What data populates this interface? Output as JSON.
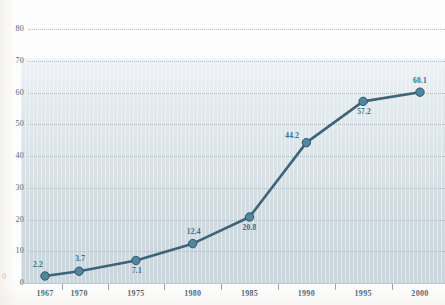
{
  "chart_data": {
    "type": "line",
    "title": "",
    "subtitle": "",
    "xlabel": "",
    "ylabel": "",
    "x": [
      1967,
      1970,
      1975,
      1980,
      1985,
      1990,
      1995,
      2000
    ],
    "categories": [
      "1967",
      "1970",
      "1975",
      "1980",
      "1985",
      "1990",
      "1995",
      "2000"
    ],
    "values": [
      2.2,
      3.7,
      7.1,
      12.4,
      20.8,
      44.2,
      57.2,
      60.1
    ],
    "point_labels": [
      "2.2",
      "3.7",
      "7.1",
      "12.4",
      "20.8",
      "44.2",
      "57.2",
      "60.1"
    ],
    "ylim": [
      0,
      80
    ],
    "xlim": [
      1965.5,
      2001.5
    ],
    "yticks": [
      0,
      10,
      20,
      30,
      40,
      50,
      60,
      70,
      80
    ],
    "ytick_labels": [
      "0",
      "10",
      "20",
      "30",
      "40",
      "50",
      "60",
      "70",
      "80"
    ],
    "grid": true,
    "grid_style": "dotted-horizontal",
    "legend": "none",
    "series": [
      {
        "name": "series-1",
        "values": [
          2.2,
          3.7,
          7.1,
          12.4,
          20.8,
          44.2,
          57.2,
          60.1
        ]
      }
    ],
    "colors": {
      "line": "#3d6478",
      "marker": "#4f87a0",
      "marker_edge": "#2f5468",
      "grid": "#9fb4bf",
      "label_text": "#3f6b84",
      "tick_text": "#2f4d5e",
      "panel_top": "#eef3f5",
      "panel_bottom": "#c9d6dd"
    }
  },
  "axis": {
    "left_stub": "0"
  }
}
